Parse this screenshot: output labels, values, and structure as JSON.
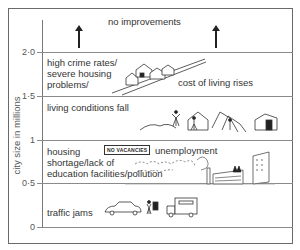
{
  "diagram": {
    "y_axis": {
      "title": "city size in millions",
      "ticks": [
        "2·0",
        "1·5",
        "1",
        "0·5",
        "0"
      ]
    },
    "bands": [
      {
        "range": "above 2.0",
        "labels": [
          "no improvements"
        ],
        "markers": [
          "up-arrow",
          "up-arrow"
        ]
      },
      {
        "range": "1.5–2.0",
        "labels": [
          "high crime rates/",
          "severe housing",
          "problems/",
          "cost of living rises"
        ]
      },
      {
        "range": "1.0–1.5",
        "labels": [
          "living conditions fall"
        ]
      },
      {
        "range": "0.5–1.0",
        "labels": [
          "housing",
          "shortage/lack of",
          "education facilities/pollution",
          "unemployment"
        ],
        "sign": "NO VACANCIES"
      },
      {
        "range": "0–0.5",
        "labels": [
          "traffic jams"
        ]
      }
    ]
  }
}
